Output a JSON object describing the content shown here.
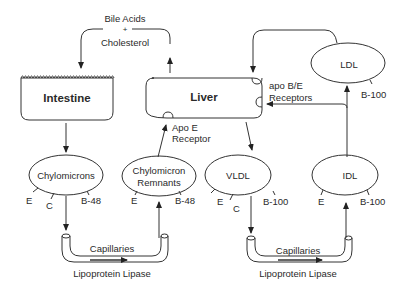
{
  "diagram": {
    "top_label": {
      "line1": "Bile Acids",
      "line2": "+",
      "line3": "Cholesterol"
    },
    "organs": [
      {
        "id": "intestine",
        "label": "Intestine"
      },
      {
        "id": "liver",
        "label": "Liver"
      }
    ],
    "receptors": {
      "apo_e": {
        "line1": "Apo E",
        "line2": "Receptor"
      },
      "apo_be": {
        "line1": "apo B/E",
        "line2": "Receptors"
      }
    },
    "particles": [
      {
        "id": "chylomicrons",
        "label": "Chylomicrons",
        "apos": [
          "E",
          "C",
          "B-48"
        ]
      },
      {
        "id": "chylomicron_remnants",
        "label_line1": "Chylomicron",
        "label_line2": "Remnants",
        "apos": [
          "E",
          "B-48"
        ]
      },
      {
        "id": "vldl",
        "label": "VLDL",
        "apos": [
          "E",
          "C",
          "B-100"
        ]
      },
      {
        "id": "idl",
        "label": "IDL",
        "apos": [
          "E",
          "B-100"
        ]
      },
      {
        "id": "ldl",
        "label": "LDL",
        "apos": [
          "B-100"
        ]
      }
    ],
    "capillaries": [
      {
        "label": "Capillaries",
        "enzyme": "Lipoprotein Lipase"
      },
      {
        "label": "Capillaries",
        "enzyme": "Lipoprotein Lipase"
      }
    ]
  }
}
